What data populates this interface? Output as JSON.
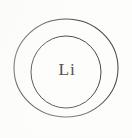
{
  "diagram": {
    "type": "bohr-shell-atom-diagram",
    "background_color": "#fdfdfb",
    "stroke_color": "#4b4a49",
    "label_color": "#55534f",
    "nucleus": {
      "label": "Li",
      "element_symbol": "Li",
      "element_name": "Lithium",
      "center_x": 67,
      "center_y": 71
    },
    "shells": [
      {
        "name": "outer-shell",
        "index": 1,
        "center_x": 66,
        "center_y": 68,
        "radius_x": 52,
        "radius_y": 49,
        "stroke_width": 1.05
      },
      {
        "name": "inner-shell",
        "index": 2,
        "center_x": 66,
        "center_y": 72,
        "radius_x": 35,
        "radius_y": 36,
        "stroke_width": 1.0
      }
    ]
  },
  "canvas": {
    "width": 132,
    "height": 138
  }
}
